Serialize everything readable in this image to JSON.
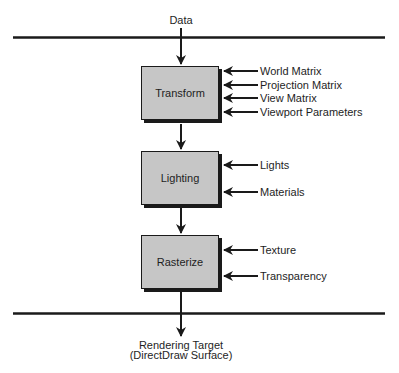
{
  "diagram": {
    "input_label": "Data",
    "output_label_line1": "Rendering Target",
    "output_label_line2": "(DirectDraw Surface)",
    "stages": [
      {
        "name": "Transform",
        "inputs": [
          "World Matrix",
          "Projection Matrix",
          "View Matrix",
          "Viewport Parameters"
        ]
      },
      {
        "name": "Lighting",
        "inputs": [
          "Lights",
          "Materials"
        ]
      },
      {
        "name": "Rasterize",
        "inputs": [
          "Texture",
          "Transparency"
        ]
      }
    ],
    "colors": {
      "box_fill": "#c6c6c6",
      "line": "#1a1a1a",
      "text": "#1e1e1e",
      "background": "#ffffff"
    }
  }
}
